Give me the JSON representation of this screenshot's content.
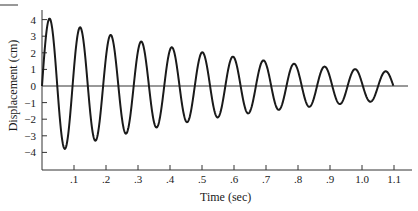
{
  "chart_data": {
    "type": "line",
    "title": "",
    "xlabel": "Time (sec)",
    "ylabel": "Displacement (cm)",
    "xlim": [
      0,
      1.17
    ],
    "ylim": [
      -4.5,
      4.5
    ],
    "x_ticks": [
      ".1",
      ".2",
      ".3",
      ".4",
      ".5",
      ".6",
      ".7",
      ".8",
      ".9",
      "1.0",
      "1.1"
    ],
    "y_ticks": [
      "4",
      "3",
      "2",
      "1",
      "0",
      "-1",
      "-2",
      "-3",
      "-4"
    ],
    "grid": false,
    "legend": null,
    "model": {
      "amplitude": 4.2,
      "decay_rate": 1.45,
      "period": 0.0955
    },
    "peaks": [
      {
        "x": 0.03,
        "y": 3.9
      },
      {
        "x": 0.125,
        "y": 3.2
      },
      {
        "x": 0.22,
        "y": 2.7
      },
      {
        "x": 0.315,
        "y": 2.3
      },
      {
        "x": 0.41,
        "y": 1.95
      },
      {
        "x": 0.505,
        "y": 1.7
      },
      {
        "x": 0.6,
        "y": 1.45
      },
      {
        "x": 0.695,
        "y": 1.25
      },
      {
        "x": 0.79,
        "y": 1.1
      },
      {
        "x": 0.885,
        "y": 0.95
      },
      {
        "x": 0.98,
        "y": 0.85
      },
      {
        "x": 1.075,
        "y": 0.75
      }
    ],
    "troughs": [
      {
        "x": 0.075,
        "y": -3.6
      },
      {
        "x": 0.17,
        "y": -3.0
      },
      {
        "x": 0.265,
        "y": -2.6
      },
      {
        "x": 0.36,
        "y": -2.2
      },
      {
        "x": 0.455,
        "y": -1.9
      },
      {
        "x": 0.55,
        "y": -1.6
      },
      {
        "x": 0.645,
        "y": -1.4
      },
      {
        "x": 0.74,
        "y": -1.2
      },
      {
        "x": 0.835,
        "y": -1.05
      },
      {
        "x": 0.93,
        "y": -0.9
      },
      {
        "x": 1.025,
        "y": -0.8
      }
    ]
  },
  "labels": {
    "xlabel": "Time (sec)",
    "ylabel": "Displacement (cm)"
  }
}
